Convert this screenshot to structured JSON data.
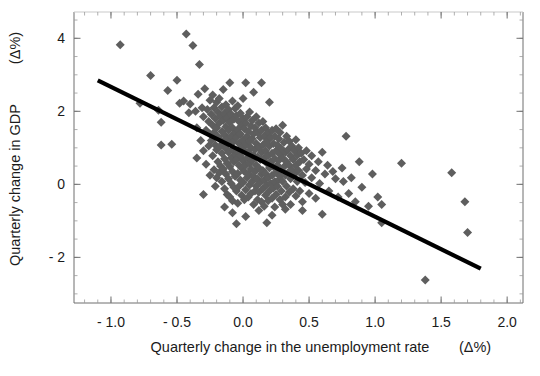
{
  "chart_data": {
    "type": "scatter",
    "title": "",
    "xlabel": "Quarterly change in the unemployment rate    (Δ%)",
    "xlabel_main": "Quarterly change in the unemployment rate",
    "xlabel_unit": "(Δ%)",
    "ylabel": "Quarterly change in GDP   (Δ%)",
    "ylabel_main": "Quarterly change in GDP",
    "ylabel_unit": "(Δ%)",
    "xlim": [
      -1.28,
      2.12
    ],
    "ylim": [
      -3.25,
      4.72
    ],
    "xticks": [
      -1.0,
      -0.5,
      0.0,
      0.5,
      1.0,
      1.5,
      2.0
    ],
    "xticklabels": [
      "- 1.0",
      "- 0.5",
      "0.0",
      "0.5",
      "1.0",
      "1.5",
      "2.0"
    ],
    "yticks": [
      4,
      2,
      0,
      -2
    ],
    "yticklabels": [
      "4",
      "2",
      "0",
      "- 2"
    ],
    "x_minor_step": 0.1,
    "y_minor_step": 0.5,
    "grid": false,
    "legend": null,
    "marker": {
      "shape": "diamond",
      "color": "#5e5e5e",
      "size": 7
    },
    "trendline": {
      "color": "#000000",
      "width": 4.2,
      "x": [
        -1.1,
        1.8
      ],
      "y": [
        2.85,
        -2.31
      ],
      "slope": -1.78,
      "intercept": 0.89
    },
    "points": [
      [
        -0.93,
        3.82
      ],
      [
        -0.78,
        2.22
      ],
      [
        -0.7,
        2.98
      ],
      [
        -0.64,
        2.03
      ],
      [
        -0.62,
        1.7
      ],
      [
        -0.57,
        2.57
      ],
      [
        -0.54,
        1.1
      ],
      [
        -0.5,
        2.85
      ],
      [
        -0.48,
        2.22
      ],
      [
        -0.45,
        2.28
      ],
      [
        -0.43,
        4.12
      ],
      [
        -0.41,
        1.96
      ],
      [
        -0.4,
        2.2
      ],
      [
        -0.38,
        3.8
      ],
      [
        -0.36,
        2.0
      ],
      [
        -0.35,
        1.55
      ],
      [
        -0.34,
        2.47
      ],
      [
        -0.33,
        3.28
      ],
      [
        -0.32,
        1.2
      ],
      [
        -0.31,
        2.1
      ],
      [
        -0.3,
        1.85
      ],
      [
        -0.3,
        0.92
      ],
      [
        -0.29,
        2.62
      ],
      [
        -0.28,
        1.48
      ],
      [
        -0.28,
        0.55
      ],
      [
        -0.27,
        2.05
      ],
      [
        -0.26,
        1.72
      ],
      [
        -0.26,
        1.05
      ],
      [
        -0.25,
        2.3
      ],
      [
        -0.25,
        1.38
      ],
      [
        -0.25,
        0.25
      ],
      [
        -0.24,
        1.92
      ],
      [
        -0.24,
        1.2
      ],
      [
        -0.23,
        2.45
      ],
      [
        -0.23,
        1.62
      ],
      [
        -0.23,
        0.78
      ],
      [
        -0.22,
        2.1
      ],
      [
        -0.22,
        1.42
      ],
      [
        -0.22,
        0.4
      ],
      [
        -0.21,
        1.8
      ],
      [
        -0.21,
        1.08
      ],
      [
        -0.21,
        -0.05
      ],
      [
        -0.2,
        2.25
      ],
      [
        -0.2,
        1.55
      ],
      [
        -0.2,
        0.95
      ],
      [
        -0.2,
        0.18
      ],
      [
        -0.19,
        1.98
      ],
      [
        -0.19,
        1.3
      ],
      [
        -0.19,
        0.62
      ],
      [
        -0.18,
        2.35
      ],
      [
        -0.18,
        1.68
      ],
      [
        -0.18,
        1.02
      ],
      [
        -0.18,
        0.32
      ],
      [
        -0.17,
        1.88
      ],
      [
        -0.17,
        1.22
      ],
      [
        -0.17,
        0.5
      ],
      [
        -0.16,
        2.12
      ],
      [
        -0.16,
        1.45
      ],
      [
        -0.16,
        0.85
      ],
      [
        -0.16,
        0.08
      ],
      [
        -0.15,
        2.6
      ],
      [
        -0.15,
        1.75
      ],
      [
        -0.15,
        1.12
      ],
      [
        -0.15,
        0.42
      ],
      [
        -0.14,
        1.95
      ],
      [
        -0.14,
        1.35
      ],
      [
        -0.14,
        0.7
      ],
      [
        -0.14,
        -0.12
      ],
      [
        -0.13,
        2.18
      ],
      [
        -0.13,
        1.58
      ],
      [
        -0.13,
        0.98
      ],
      [
        -0.13,
        0.28
      ],
      [
        -0.12,
        1.82
      ],
      [
        -0.12,
        1.25
      ],
      [
        -0.12,
        0.58
      ],
      [
        -0.12,
        -0.28
      ],
      [
        -0.11,
        2.05
      ],
      [
        -0.11,
        1.48
      ],
      [
        -0.11,
        0.88
      ],
      [
        -0.11,
        0.15
      ],
      [
        -0.1,
        2.78
      ],
      [
        -0.1,
        1.7
      ],
      [
        -0.1,
        1.15
      ],
      [
        -0.1,
        0.48
      ],
      [
        -0.1,
        -0.35
      ],
      [
        -0.09,
        1.92
      ],
      [
        -0.09,
        1.32
      ],
      [
        -0.09,
        0.72
      ],
      [
        -0.09,
        0.02
      ],
      [
        -0.08,
        2.28
      ],
      [
        -0.08,
        1.55
      ],
      [
        -0.08,
        0.95
      ],
      [
        -0.08,
        0.35
      ],
      [
        -0.08,
        -0.45
      ],
      [
        -0.07,
        1.78
      ],
      [
        -0.07,
        1.18
      ],
      [
        -0.07,
        0.62
      ],
      [
        -0.07,
        -0.08
      ],
      [
        -0.06,
        2.08
      ],
      [
        -0.06,
        1.42
      ],
      [
        -0.06,
        0.82
      ],
      [
        -0.06,
        0.22
      ],
      [
        -0.05,
        1.88
      ],
      [
        -0.05,
        1.28
      ],
      [
        -0.05,
        0.68
      ],
      [
        -0.05,
        -0.18
      ],
      [
        -0.04,
        2.15
      ],
      [
        -0.04,
        1.5
      ],
      [
        -0.04,
        0.9
      ],
      [
        -0.04,
        0.3
      ],
      [
        -0.04,
        -0.52
      ],
      [
        -0.03,
        1.72
      ],
      [
        -0.03,
        1.12
      ],
      [
        -0.03,
        0.52
      ],
      [
        -0.03,
        -0.05
      ],
      [
        -0.02,
        1.95
      ],
      [
        -0.02,
        1.38
      ],
      [
        -0.02,
        0.78
      ],
      [
        -0.02,
        0.12
      ],
      [
        -0.01,
        1.62
      ],
      [
        -0.01,
        1.02
      ],
      [
        -0.01,
        0.45
      ],
      [
        -0.01,
        -0.3
      ],
      [
        0.0,
        2.35
      ],
      [
        0.0,
        1.8
      ],
      [
        0.0,
        1.22
      ],
      [
        0.0,
        0.65
      ],
      [
        0.0,
        0.05
      ],
      [
        0.01,
        1.52
      ],
      [
        0.01,
        0.92
      ],
      [
        0.01,
        0.35
      ],
      [
        0.01,
        -0.42
      ],
      [
        0.02,
        2.78
      ],
      [
        0.02,
        1.68
      ],
      [
        0.02,
        1.08
      ],
      [
        0.02,
        0.52
      ],
      [
        0.02,
        -0.15
      ],
      [
        0.03,
        1.85
      ],
      [
        0.03,
        1.32
      ],
      [
        0.03,
        0.72
      ],
      [
        0.03,
        0.18
      ],
      [
        0.04,
        1.45
      ],
      [
        0.04,
        0.88
      ],
      [
        0.04,
        0.28
      ],
      [
        0.04,
        -0.35
      ],
      [
        0.05,
        1.98
      ],
      [
        0.05,
        1.18
      ],
      [
        0.05,
        0.58
      ],
      [
        0.05,
        -0.02
      ],
      [
        0.06,
        1.6
      ],
      [
        0.06,
        1.0
      ],
      [
        0.06,
        0.42
      ],
      [
        0.06,
        -0.25
      ],
      [
        0.07,
        1.75
      ],
      [
        0.07,
        1.25
      ],
      [
        0.07,
        0.65
      ],
      [
        0.07,
        0.08
      ],
      [
        0.08,
        2.52
      ],
      [
        0.08,
        1.38
      ],
      [
        0.08,
        0.8
      ],
      [
        0.08,
        0.22
      ],
      [
        0.08,
        -0.55
      ],
      [
        0.09,
        1.55
      ],
      [
        0.09,
        0.95
      ],
      [
        0.09,
        0.35
      ],
      [
        0.09,
        -0.18
      ],
      [
        0.1,
        1.85
      ],
      [
        0.1,
        1.12
      ],
      [
        0.1,
        0.52
      ],
      [
        0.1,
        -0.05
      ],
      [
        0.11,
        1.42
      ],
      [
        0.11,
        0.75
      ],
      [
        0.11,
        0.15
      ],
      [
        0.11,
        -0.42
      ],
      [
        0.12,
        1.68
      ],
      [
        0.12,
        1.02
      ],
      [
        0.12,
        0.45
      ],
      [
        0.12,
        -0.22
      ],
      [
        0.13,
        1.28
      ],
      [
        0.13,
        0.68
      ],
      [
        0.13,
        0.05
      ],
      [
        0.14,
        2.78
      ],
      [
        0.14,
        1.48
      ],
      [
        0.14,
        0.88
      ],
      [
        0.14,
        0.28
      ],
      [
        0.14,
        -0.48
      ],
      [
        0.15,
        1.72
      ],
      [
        0.15,
        1.08
      ],
      [
        0.15,
        0.38
      ],
      [
        0.15,
        -0.12
      ],
      [
        0.16,
        1.32
      ],
      [
        0.16,
        0.72
      ],
      [
        0.16,
        0.12
      ],
      [
        0.16,
        -0.6
      ],
      [
        0.17,
        1.55
      ],
      [
        0.17,
        0.92
      ],
      [
        0.17,
        0.3
      ],
      [
        0.17,
        -0.3
      ],
      [
        0.18,
        1.18
      ],
      [
        0.18,
        0.58
      ],
      [
        0.18,
        -0.02
      ],
      [
        0.19,
        1.42
      ],
      [
        0.19,
        0.78
      ],
      [
        0.19,
        0.18
      ],
      [
        0.19,
        -0.45
      ],
      [
        0.2,
        2.25
      ],
      [
        0.2,
        1.05
      ],
      [
        0.2,
        0.45
      ],
      [
        0.2,
        -0.18
      ],
      [
        0.21,
        1.28
      ],
      [
        0.21,
        0.62
      ],
      [
        0.21,
        0.02
      ],
      [
        0.22,
        1.48
      ],
      [
        0.22,
        0.85
      ],
      [
        0.22,
        0.25
      ],
      [
        0.22,
        -0.38
      ],
      [
        0.23,
        1.12
      ],
      [
        0.23,
        0.48
      ],
      [
        0.23,
        -0.1
      ],
      [
        0.24,
        1.32
      ],
      [
        0.24,
        0.7
      ],
      [
        0.24,
        0.08
      ],
      [
        0.24,
        -0.62
      ],
      [
        0.25,
        1.52
      ],
      [
        0.25,
        0.92
      ],
      [
        0.25,
        0.32
      ],
      [
        0.25,
        -0.28
      ],
      [
        0.26,
        1.08
      ],
      [
        0.26,
        0.52
      ],
      [
        0.26,
        -0.05
      ],
      [
        0.27,
        1.25
      ],
      [
        0.27,
        0.65
      ],
      [
        0.27,
        0.12
      ],
      [
        0.28,
        1.42
      ],
      [
        0.28,
        0.82
      ],
      [
        0.28,
        0.22
      ],
      [
        0.28,
        -0.42
      ],
      [
        0.29,
        0.98
      ],
      [
        0.29,
        0.38
      ],
      [
        0.29,
        -0.18
      ],
      [
        0.3,
        1.62
      ],
      [
        0.3,
        0.72
      ],
      [
        0.3,
        0.08
      ],
      [
        0.3,
        -0.55
      ],
      [
        0.31,
        1.15
      ],
      [
        0.31,
        0.48
      ],
      [
        0.32,
        0.88
      ],
      [
        0.32,
        0.25
      ],
      [
        0.32,
        -0.35
      ],
      [
        0.33,
        1.32
      ],
      [
        0.33,
        0.62
      ],
      [
        0.33,
        -0.05
      ],
      [
        0.34,
        0.95
      ],
      [
        0.34,
        0.32
      ],
      [
        0.35,
        1.18
      ],
      [
        0.35,
        0.52
      ],
      [
        0.35,
        -0.22
      ],
      [
        0.36,
        0.78
      ],
      [
        0.36,
        0.15
      ],
      [
        0.37,
        1.05
      ],
      [
        0.37,
        0.4
      ],
      [
        0.38,
        0.68
      ],
      [
        0.38,
        -0.12
      ],
      [
        0.39,
        0.92
      ],
      [
        0.39,
        0.28
      ],
      [
        0.4,
        1.22
      ],
      [
        0.4,
        0.52
      ],
      [
        0.4,
        -0.32
      ],
      [
        0.41,
        0.8
      ],
      [
        0.41,
        0.08
      ],
      [
        0.42,
        1.0
      ],
      [
        0.42,
        0.38
      ],
      [
        0.43,
        0.62
      ],
      [
        0.43,
        -0.18
      ],
      [
        0.44,
        0.85
      ],
      [
        0.45,
        0.25
      ],
      [
        0.45,
        -0.48
      ],
      [
        0.46,
        0.68
      ],
      [
        0.47,
        0.05
      ],
      [
        0.48,
        0.92
      ],
      [
        0.48,
        0.42
      ],
      [
        0.5,
        0.55
      ],
      [
        0.5,
        -0.25
      ],
      [
        0.52,
        0.78
      ],
      [
        0.52,
        0.18
      ],
      [
        0.55,
        0.38
      ],
      [
        0.55,
        -0.38
      ],
      [
        0.57,
        0.62
      ],
      [
        0.58,
        0.02
      ],
      [
        0.6,
        0.88
      ],
      [
        0.6,
        -0.82
      ],
      [
        0.62,
        0.28
      ],
      [
        0.64,
        0.52
      ],
      [
        0.65,
        -0.18
      ],
      [
        0.68,
        0.35
      ],
      [
        0.7,
        0.15
      ],
      [
        0.72,
        -0.35
      ],
      [
        0.75,
        0.45
      ],
      [
        0.76,
        0.08
      ],
      [
        0.78,
        1.32
      ],
      [
        0.8,
        -0.25
      ],
      [
        0.82,
        0.18
      ],
      [
        0.85,
        -0.48
      ],
      [
        0.88,
        0.62
      ],
      [
        0.9,
        -0.08
      ],
      [
        0.95,
        -0.6
      ],
      [
        0.98,
        0.28
      ],
      [
        1.02,
        -0.35
      ],
      [
        1.05,
        -1.05
      ],
      [
        1.05,
        -0.55
      ],
      [
        1.2,
        0.58
      ],
      [
        1.38,
        -2.62
      ],
      [
        1.58,
        0.32
      ],
      [
        1.68,
        -0.48
      ],
      [
        1.7,
        -1.32
      ],
      [
        -0.62,
        1.08
      ],
      [
        -0.35,
        0.72
      ],
      [
        -0.3,
        -0.28
      ],
      [
        0.32,
        -0.68
      ],
      [
        0.36,
        -0.55
      ],
      [
        0.22,
        -0.85
      ],
      [
        0.12,
        -0.72
      ],
      [
        0.02,
        -0.88
      ],
      [
        -0.08,
        -0.78
      ],
      [
        -0.14,
        -0.62
      ],
      [
        0.45,
        -0.72
      ],
      [
        0.18,
        -1.05
      ],
      [
        -0.05,
        -1.08
      ]
    ]
  }
}
